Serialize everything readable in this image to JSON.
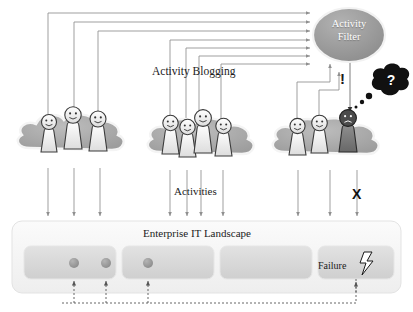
{
  "diagram": {
    "labels": {
      "activity_blogging": "Activity Blogging",
      "activities": "Activities",
      "enterprise_it_landscape": "Enterprise IT Landscape",
      "failure": "Failure",
      "exclamation": "!",
      "cross": "X",
      "question": "?"
    },
    "activity_filter": {
      "line1": "Activity",
      "line2": "Filter",
      "fill": "#9a9a9a",
      "text_color": "#ffffff"
    },
    "groups": [
      {
        "id": "group-left",
        "people": 3,
        "cloud_fill": "#a8a8a8",
        "figures": [
          {
            "id": "person-l1",
            "mood": "happy",
            "fill": "#f2f2f2"
          },
          {
            "id": "person-l2",
            "mood": "happy",
            "fill": "#f2f2f2"
          },
          {
            "id": "person-l3",
            "mood": "happy",
            "fill": "#f2f2f2"
          }
        ]
      },
      {
        "id": "group-middle",
        "people": 4,
        "cloud_fill": "#a8a8a8",
        "figures": [
          {
            "id": "person-m1",
            "mood": "happy",
            "fill": "#f2f2f2"
          },
          {
            "id": "person-m2",
            "mood": "happy",
            "fill": "#f2f2f2"
          },
          {
            "id": "person-m3",
            "mood": "happy",
            "fill": "#f2f2f2"
          },
          {
            "id": "person-m4",
            "mood": "happy",
            "fill": "#f2f2f2"
          }
        ]
      },
      {
        "id": "group-right",
        "people": 3,
        "cloud_fill": "#a8a8a8",
        "figures": [
          {
            "id": "person-r1",
            "mood": "happy",
            "fill": "#f2f2f2"
          },
          {
            "id": "person-r2",
            "mood": "happy",
            "fill": "#f2f2f2"
          },
          {
            "id": "person-r3",
            "mood": "sad",
            "fill": "#777777"
          }
        ]
      }
    ],
    "landscape": {
      "label": "Enterprise IT Landscape",
      "box_fill": "#f2f2f2",
      "inner_fill": "#d8d8d8",
      "systems": [
        {
          "id": "system-1",
          "dots": 2
        },
        {
          "id": "system-2",
          "dots": 1
        },
        {
          "id": "system-3",
          "dots": 0
        },
        {
          "id": "system-4",
          "dots": 0,
          "label": "Failure",
          "icon": "lightning-bolt-icon"
        }
      ]
    },
    "colors": {
      "line": "#8f8f8f",
      "dark_line": "#4a4a4a",
      "dot": "#9a9a9a",
      "thought_bubble": "#111111",
      "background": "#ffffff"
    },
    "flows": {
      "blog_lines": 7,
      "activity_arrows": 9,
      "feedback_dashed": true
    }
  }
}
